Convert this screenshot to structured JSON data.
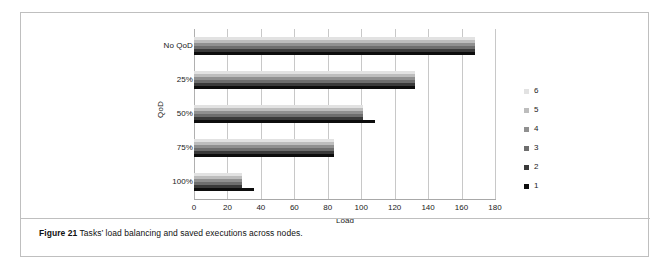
{
  "figure": {
    "caption_prefix": "Figure 21",
    "caption_rest": " Tasks’ load balancing and saved executions across nodes."
  },
  "chart_data": {
    "type": "bar",
    "orientation": "horizontal",
    "title": "",
    "xlabel": "Load",
    "ylabel": "QoD",
    "categories": [
      "No QoD",
      "25%",
      "50%",
      "75%",
      "100%"
    ],
    "xlim": [
      0,
      180
    ],
    "xticks": [
      0,
      20,
      40,
      60,
      80,
      100,
      120,
      140,
      160,
      180
    ],
    "grid": true,
    "legend_position": "right",
    "legend_title": "",
    "series": [
      {
        "name": "1",
        "color": "#0d0d0d",
        "values": [
          168,
          132,
          108,
          84,
          36
        ]
      },
      {
        "name": "2",
        "color": "#3a3a3a",
        "values": [
          168,
          132,
          101,
          84,
          29
        ]
      },
      {
        "name": "3",
        "color": "#6e6e6e",
        "values": [
          168,
          132,
          101,
          84,
          29
        ]
      },
      {
        "name": "4",
        "color": "#909090",
        "values": [
          168,
          132,
          101,
          84,
          29
        ]
      },
      {
        "name": "5",
        "color": "#bdbdbd",
        "values": [
          168,
          132,
          101,
          84,
          29
        ]
      },
      {
        "name": "6",
        "color": "#e2e2e2",
        "values": [
          168,
          132,
          101,
          84,
          29
        ]
      }
    ],
    "legend_entries": [
      {
        "label": "6",
        "color": "#e2e2e2"
      },
      {
        "label": "5",
        "color": "#bdbdbd"
      },
      {
        "label": "4",
        "color": "#909090"
      },
      {
        "label": "3",
        "color": "#6e6e6e"
      },
      {
        "label": "2",
        "color": "#3a3a3a"
      },
      {
        "label": "1",
        "color": "#0d0d0d"
      }
    ]
  }
}
